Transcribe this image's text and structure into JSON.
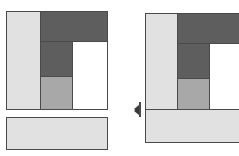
{
  "scene": {
    "title": "Two block-layout figures",
    "background": "#ffffff",
    "width": 239,
    "height": 156
  },
  "palette": {
    "light_gray": "#e1e1e1",
    "medium_gray": "#a8a8a8",
    "dark_gray": "#5e5e5e",
    "white": "#ffffff",
    "outline": "#4a4a4a",
    "marker": "#3a3a3a"
  },
  "figures": [
    {
      "name": "left-figure",
      "label": "Detached footer layout",
      "blocks": [
        {
          "name": "sidebar-block",
          "label": "sidebar",
          "fill": "#e1e1e1",
          "x": 6,
          "y": 11,
          "w": 35,
          "h": 99
        },
        {
          "name": "header-block",
          "label": "header",
          "fill": "#5e5e5e",
          "x": 40,
          "y": 11,
          "w": 68,
          "h": 31
        },
        {
          "name": "nav-block",
          "label": "nav",
          "fill": "#5e5e5e",
          "x": 40,
          "y": 41,
          "w": 33,
          "h": 36
        },
        {
          "name": "aside-block",
          "label": "aside",
          "fill": "#a8a8a8",
          "x": 40,
          "y": 76,
          "w": 33,
          "h": 34
        },
        {
          "name": "content-block",
          "label": "content",
          "fill": "#ffffff",
          "x": 72,
          "y": 41,
          "w": 36,
          "h": 69
        }
      ],
      "detached": [
        {
          "name": "footer-block",
          "label": "footer",
          "fill": "#e1e1e1",
          "x": 6,
          "y": 117,
          "w": 102,
          "h": 33
        }
      ]
    },
    {
      "name": "right-figure",
      "label": "Attached footer layout",
      "blocks": [
        {
          "name": "sidebar-block",
          "label": "sidebar",
          "fill": "#e1e1e1",
          "x": 145,
          "y": 13,
          "w": 33,
          "h": 97
        },
        {
          "name": "header-block",
          "label": "header",
          "fill": "#5e5e5e",
          "x": 177,
          "y": 13,
          "w": 68,
          "h": 31
        },
        {
          "name": "nav-block",
          "label": "nav",
          "fill": "#5e5e5e",
          "x": 177,
          "y": 43,
          "w": 33,
          "h": 36
        },
        {
          "name": "aside-block",
          "label": "aside",
          "fill": "#a8a8a8",
          "x": 177,
          "y": 78,
          "w": 33,
          "h": 32
        },
        {
          "name": "content-block",
          "label": "content",
          "fill": "#ffffff",
          "x": 209,
          "y": 43,
          "w": 36,
          "h": 67
        },
        {
          "name": "footer-block",
          "label": "footer",
          "fill": "#e1e1e1",
          "x": 145,
          "y": 109,
          "w": 100,
          "h": 34
        }
      ],
      "marker": {
        "name": "resize-handle",
        "label": "vertical alignment marker",
        "x": 134,
        "y": 102,
        "w": 8,
        "h": 15
      }
    }
  ]
}
